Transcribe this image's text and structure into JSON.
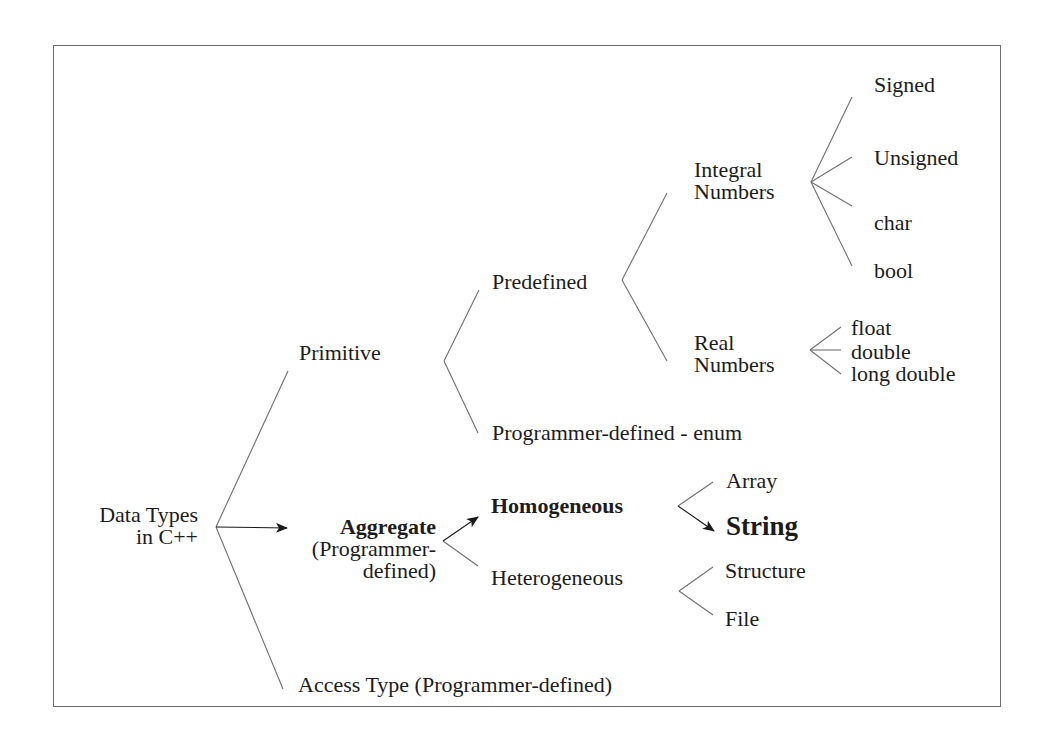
{
  "diagram": {
    "type": "tree",
    "root": {
      "label_line1": "Data Types",
      "label_line2": "in C++"
    },
    "level1": {
      "primitive": "Primitive",
      "aggregate": "Aggregate",
      "aggregate_sub_line1": "(Programmer-",
      "aggregate_sub_line2": "defined)",
      "access_type": "Access Type (Programmer-defined)"
    },
    "primitive_children": {
      "predefined": "Predefined",
      "programmer_defined_enum": "Programmer-defined - enum"
    },
    "predefined_children": {
      "integral_line1": "Integral",
      "integral_line2": "Numbers",
      "real_line1": "Real",
      "real_line2": "Numbers"
    },
    "integral_children": [
      "Signed",
      "Unsigned",
      "char",
      "bool"
    ],
    "real_children": [
      "float",
      "double",
      "long double"
    ],
    "aggregate_children": {
      "homogeneous": "Homogeneous",
      "heterogeneous": "Heterogeneous"
    },
    "homogeneous_children": [
      "Array",
      "String"
    ],
    "heterogeneous_children": [
      "Structure",
      "File"
    ],
    "highlighted_path": [
      "Data Types in C++",
      "Aggregate",
      "Homogeneous",
      "String"
    ],
    "colors": {
      "line": "#707070",
      "arrow": "#1a1a1a",
      "text": "#1c1c1c",
      "frame": "#6e6e6e"
    }
  }
}
